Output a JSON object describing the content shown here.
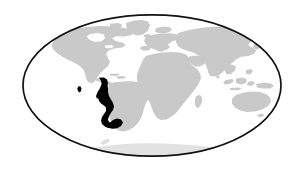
{
  "figure": {
    "type": "distribution-map",
    "caption": "",
    "background_color": "#ffffff"
  },
  "map": {
    "projection": "mollweide-oval",
    "frame": {
      "shape": "ellipse",
      "center_x": 152,
      "center_y": 85.5,
      "radius_x": 130,
      "radius_y": 71.5,
      "stroke_color": "#111111",
      "stroke_width": 1.7,
      "fill_color": "#ffffff"
    },
    "land": {
      "label": "landmasses",
      "fill_color": "#c9c9c9"
    },
    "highlight": {
      "label": "highlighted range",
      "region_name": "western South America",
      "fill_color": "#000000"
    },
    "polar_land": {
      "label": "antarctica",
      "fill_color": "#e2e2e2"
    },
    "regions": [
      {
        "name": "north-america",
        "style": "land"
      },
      {
        "name": "central-america",
        "style": "land"
      },
      {
        "name": "south-america",
        "style": "land"
      },
      {
        "name": "greenland",
        "style": "land"
      },
      {
        "name": "europe",
        "style": "land"
      },
      {
        "name": "africa",
        "style": "land"
      },
      {
        "name": "madagascar",
        "style": "land"
      },
      {
        "name": "asia",
        "style": "land"
      },
      {
        "name": "japan",
        "style": "land"
      },
      {
        "name": "indonesia",
        "style": "land"
      },
      {
        "name": "new-guinea",
        "style": "land"
      },
      {
        "name": "australia",
        "style": "land"
      },
      {
        "name": "new-zealand",
        "style": "land"
      },
      {
        "name": "british-isles",
        "style": "land"
      },
      {
        "name": "antarctica",
        "style": "polar_land"
      },
      {
        "name": "andean-range",
        "style": "highlight"
      },
      {
        "name": "galapagos-marker",
        "style": "highlight"
      }
    ]
  }
}
